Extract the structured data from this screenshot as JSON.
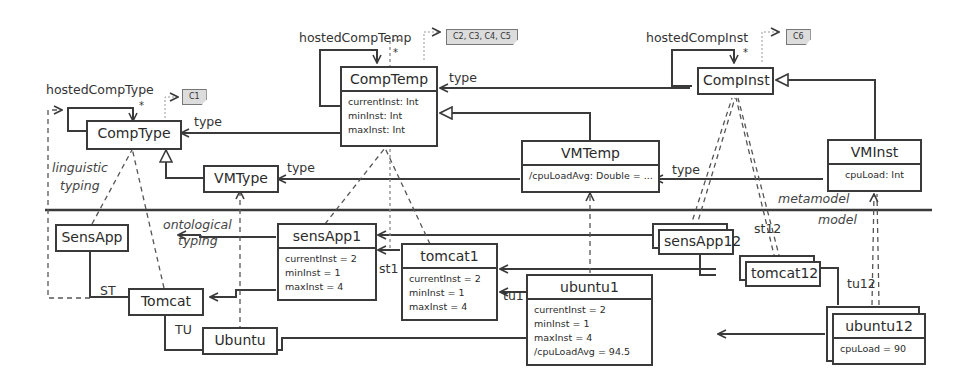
{
  "metamodel": {
    "comp_type": {
      "name": "CompType",
      "self_assoc": "hostedCompType",
      "multiplicity": "*",
      "constraint": "C1"
    },
    "comp_temp": {
      "name": "CompTemp",
      "self_assoc": "hostedCompTemp",
      "multiplicity": "*",
      "constraint": "C2, C3, C4, C5",
      "attrs": [
        "currentInst: Int",
        "minInst: Int",
        "maxInst: Int"
      ]
    },
    "comp_inst": {
      "name": "CompInst",
      "self_assoc": "hostedCompInst",
      "multiplicity": "*",
      "constraint": "C6"
    },
    "vm_type": {
      "name": "VMType"
    },
    "vm_temp": {
      "name": "VMTemp",
      "attrs": [
        "/cpuLoadAvg: Double = ..."
      ]
    },
    "vm_inst": {
      "name": "VMInst",
      "attrs": [
        "cpuLoad: Int"
      ]
    },
    "edge_labels": {
      "temp_type": "type",
      "inst_type": "type",
      "vmtemp_type": "type",
      "vminst_type": "type"
    }
  },
  "layers": {
    "metamodel": "metamodel",
    "model": "model"
  },
  "annotations": {
    "linguistic": "linguistic\ntyping",
    "linguistic_1": "linguistic",
    "linguistic_2": "typing",
    "ontological_1": "ontological",
    "ontological_2": "typing"
  },
  "model": {
    "sens_app": {
      "name": "SensApp"
    },
    "tomcat": {
      "name": "Tomcat"
    },
    "ubuntu": {
      "name": "Ubuntu"
    },
    "sens_app1": {
      "name": "sensApp1",
      "attrs": [
        "currentInst = 2",
        "minInst = 1",
        "maxInst = 4"
      ]
    },
    "tomcat1": {
      "name": "tomcat1",
      "attrs": [
        "currentInst = 2",
        "minInst = 1",
        "maxInst = 4"
      ]
    },
    "ubuntu1": {
      "name": "ubuntu1",
      "attrs": [
        "currentInst = 2",
        "minInst = 1",
        "maxInst = 4",
        "/cpuLoadAvg = 94.5"
      ]
    },
    "sens_app12": {
      "name": "sensApp12"
    },
    "tomcat12": {
      "name": "tomcat12"
    },
    "ubuntu12": {
      "name": "ubuntu12",
      "attrs": [
        "cpuLoad = 90"
      ]
    },
    "edge_labels": {
      "st": "ST",
      "tu": "TU",
      "st1": "st1",
      "tu1": "tu1",
      "st12": "st12",
      "tu12": "tu12"
    }
  }
}
